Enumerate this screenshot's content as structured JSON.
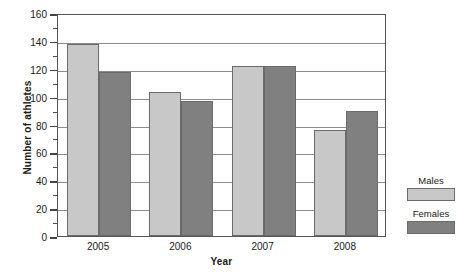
{
  "chart_data": {
    "type": "bar",
    "title": "",
    "xlabel": "Year",
    "ylabel": "Number of athletes",
    "categories": [
      "2005",
      "2006",
      "2007",
      "2008"
    ],
    "series": [
      {
        "name": "Males",
        "color": "#c8c8c8",
        "values": [
          138,
          103,
          122,
          76
        ]
      },
      {
        "name": "Females",
        "color": "#808080",
        "values": [
          118,
          97,
          122,
          90
        ]
      }
    ],
    "ylim": [
      0,
      160
    ],
    "ytick_step": 20,
    "yticks": [
      "0",
      "20",
      "40",
      "60",
      "80",
      "100",
      "120",
      "140",
      "160"
    ],
    "minor_tick_step": 10,
    "grid": "horizontal",
    "legend_position": "right",
    "legend": [
      {
        "label": "Males",
        "color": "#c8c8c8"
      },
      {
        "label": "Females",
        "color": "#808080"
      }
    ]
  }
}
